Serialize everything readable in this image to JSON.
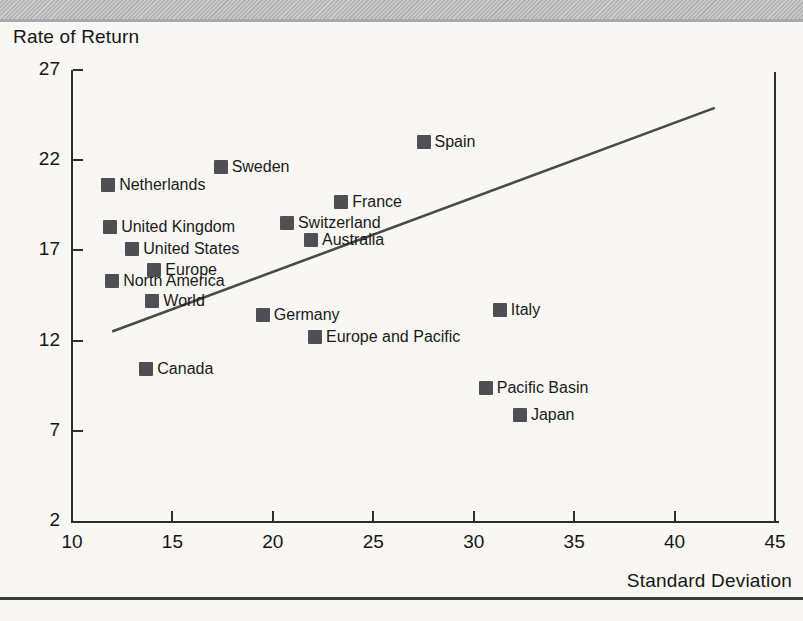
{
  "page": {
    "background_color": "#f8f7f3",
    "top_band_color": "#bdbdbd",
    "bottom_rule_color": "#3d3d3d"
  },
  "chart_data": {
    "type": "scatter",
    "ylabel": "Rate of Return",
    "xlabel": "Standard Deviation",
    "xlim": [
      10,
      45
    ],
    "ylim": [
      2,
      27
    ],
    "x_ticks": [
      10,
      15,
      20,
      25,
      30,
      35,
      40,
      45
    ],
    "y_ticks": [
      2,
      7,
      12,
      17,
      22,
      27
    ],
    "grid": false,
    "legend": "none",
    "marker": {
      "shape": "square",
      "color": "#505054",
      "size_px": 14
    },
    "points": [
      {
        "label": "Netherlands",
        "x": 11.8,
        "y": 20.6
      },
      {
        "label": "United Kingdom",
        "x": 11.9,
        "y": 18.3
      },
      {
        "label": "North America",
        "x": 12.0,
        "y": 15.3
      },
      {
        "label": "United States",
        "x": 13.0,
        "y": 17.1
      },
      {
        "label": "Canada",
        "x": 13.7,
        "y": 10.4
      },
      {
        "label": "World",
        "x": 14.0,
        "y": 14.2
      },
      {
        "label": "Europe",
        "x": 14.1,
        "y": 15.9
      },
      {
        "label": "Sweden",
        "x": 17.4,
        "y": 21.6
      },
      {
        "label": "Germany",
        "x": 19.5,
        "y": 13.4
      },
      {
        "label": "Switzerland",
        "x": 20.7,
        "y": 18.5
      },
      {
        "label": "Australia",
        "x": 21.9,
        "y": 17.6
      },
      {
        "label": "Europe and Pacific",
        "x": 22.1,
        "y": 12.2
      },
      {
        "label": "France",
        "x": 23.4,
        "y": 19.7
      },
      {
        "label": "Spain",
        "x": 27.5,
        "y": 23.0
      },
      {
        "label": "Pacific Basin",
        "x": 30.6,
        "y": 9.4
      },
      {
        "label": "Italy",
        "x": 31.3,
        "y": 13.7
      },
      {
        "label": "Japan",
        "x": 32.3,
        "y": 7.9
      }
    ],
    "trend_line": {
      "x1": 12.0,
      "y1": 12.5,
      "x2": 42.0,
      "y2": 24.9,
      "color": "#4a4a4a"
    }
  }
}
